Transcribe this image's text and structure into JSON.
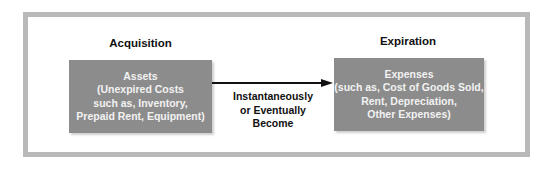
{
  "left": {
    "heading": "Acquisition",
    "box_lines": [
      "Assets",
      "(Unexpired Costs",
      "such as, Inventory,",
      "Prepaid Rent, Equipment)"
    ]
  },
  "right": {
    "heading": "Expiration",
    "box_lines": [
      "Expenses",
      "(such as, Cost of Goods Sold,",
      "Rent, Depreciation,",
      "Other Expenses)"
    ]
  },
  "connector": {
    "lines": [
      "Instantaneously",
      "or Eventually",
      "Become"
    ]
  },
  "colors": {
    "box": "#8c8c8c",
    "frame": "#b9b9b9",
    "text_dark": "#111111"
  }
}
